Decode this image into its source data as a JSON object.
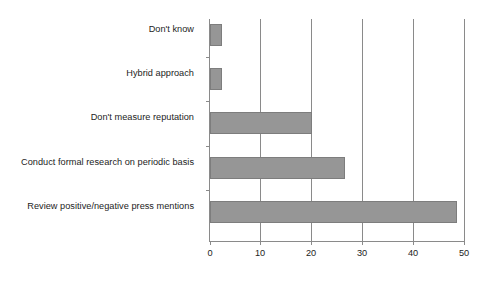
{
  "chart_data": {
    "type": "bar",
    "orientation": "horizontal",
    "title": "",
    "subtitle": "",
    "xlabel": "",
    "ylabel": "",
    "categories": [
      "Review positive/negative press mentions",
      "Conduct formal research on periodic basis",
      "Don't measure reputation",
      "Hybrid approach",
      "Don't know"
    ],
    "values": [
      48.5,
      26.5,
      20,
      2.3,
      2.3
    ],
    "xlim": [
      0,
      50
    ],
    "xticks": [
      0,
      10,
      20,
      30,
      40,
      50
    ],
    "xtick_labels": [
      "0",
      "10",
      "20",
      "30",
      "40",
      "50"
    ],
    "grid": "vertical",
    "legend": "none",
    "bar_color": "#969696",
    "bar_edge_color": "#7d7d7d",
    "axis_color": "#8a8a8a",
    "background": "#ffffff"
  }
}
